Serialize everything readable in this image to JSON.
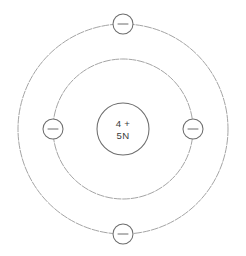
{
  "diagram": {
    "background_color": "#ffffff",
    "line_color": "#9a9a9a",
    "ink_color": "#6d6d6d",
    "text_color": "#3a3a3a",
    "center": {
      "x": 123,
      "y": 129
    },
    "nucleus": {
      "label_name": "nucleus",
      "radius": 26,
      "protons_line": "4 +",
      "neutrons_line": "5N"
    },
    "shells": [
      {
        "name": "inner-shell",
        "radius": 70,
        "electron_count": 2
      },
      {
        "name": "outer-shell",
        "radius": 105,
        "electron_count": 2
      }
    ],
    "electrons": [
      {
        "name": "electron-outer-top",
        "shell": "outer-shell",
        "position": "top",
        "cx": 123,
        "cy": 24,
        "r": 10,
        "charge": "-"
      },
      {
        "name": "electron-inner-left",
        "shell": "inner-shell",
        "position": "left",
        "cx": 53,
        "cy": 129,
        "r": 10,
        "charge": "-"
      },
      {
        "name": "electron-inner-right",
        "shell": "inner-shell",
        "position": "right",
        "cx": 193,
        "cy": 129,
        "r": 10,
        "charge": "-"
      },
      {
        "name": "electron-outer-bottom",
        "shell": "outer-shell",
        "position": "bottom",
        "cx": 123,
        "cy": 234,
        "r": 10,
        "charge": "-"
      }
    ]
  }
}
